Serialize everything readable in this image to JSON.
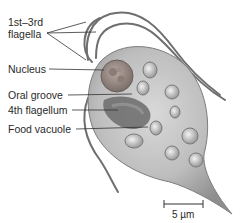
{
  "figure": {
    "labels": [
      {
        "id": "flagella",
        "line1": "1st–3rd",
        "line2": "flagella"
      },
      {
        "id": "nucleus",
        "text": "Nucleus"
      },
      {
        "id": "oral-groove",
        "text": "Oral groove"
      },
      {
        "id": "fourth-flagellum",
        "text": "4th flagellum"
      },
      {
        "id": "food-vacuole",
        "text": "Food vacuole"
      }
    ],
    "scale_bar": {
      "text": "5 µm"
    },
    "colors": {
      "cell_body": "#bdbdbd",
      "cell_shadow": "#8c8c8c",
      "flagella": "#6f6f6f",
      "leader": "#333333",
      "text": "#2a2a2a"
    }
  }
}
